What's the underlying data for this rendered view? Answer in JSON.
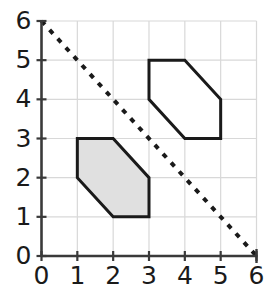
{
  "chart_data": {
    "type": "scatter",
    "title": "",
    "xlabel": "",
    "ylabel": "",
    "xlim": [
      0,
      6
    ],
    "ylim": [
      0,
      6
    ],
    "xticks": [
      "0",
      "1",
      "2",
      "3",
      "4",
      "5",
      "6"
    ],
    "yticks": [
      "0",
      "1",
      "2",
      "3",
      "4",
      "5",
      "6"
    ],
    "grid": true,
    "grid_color": "#d8d8d8",
    "axis_color": "#3a3a3a",
    "legend": "none",
    "shapes": [
      {
        "name": "shaded-hexagon",
        "kind": "polygon",
        "fill": "#e0e0e0",
        "stroke": "#1a1a1a",
        "stroke_width": 3,
        "vertices": [
          [
            1,
            3
          ],
          [
            2,
            3
          ],
          [
            3,
            2
          ],
          [
            3,
            1
          ],
          [
            2,
            1
          ],
          [
            1,
            2
          ]
        ]
      },
      {
        "name": "outline-hexagon",
        "kind": "polygon",
        "fill": "#ffffff",
        "stroke": "#1a1a1a",
        "stroke_width": 3,
        "vertices": [
          [
            3,
            5
          ],
          [
            4,
            5
          ],
          [
            5,
            4
          ],
          [
            5,
            3
          ],
          [
            4,
            3
          ],
          [
            3,
            4
          ]
        ]
      },
      {
        "name": "dashed-line",
        "kind": "line",
        "stroke": "#1a1a1a",
        "stroke_width": 4,
        "dash": "dotted",
        "from": [
          0,
          6
        ],
        "to": [
          6,
          0
        ]
      }
    ]
  },
  "axes": {
    "x_tick_labels": [
      "0",
      "1",
      "2",
      "3",
      "4",
      "5",
      "6"
    ],
    "y_tick_labels": [
      "0",
      "1",
      "2",
      "3",
      "4",
      "5",
      "6"
    ]
  }
}
